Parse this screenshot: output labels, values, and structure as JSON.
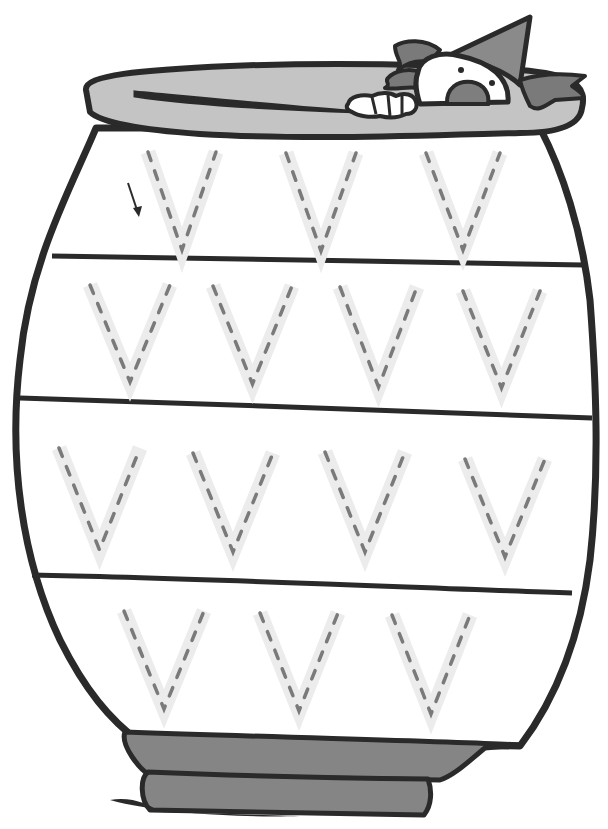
{
  "worksheet": {
    "letter": "V",
    "description": "Letter V tracing worksheet: a pot with four bands of dashed V letters and a clown peeking over the rim",
    "colors": {
      "outline": "#2a2a2a",
      "rim_fill": "#c4c4c4",
      "base_fill": "#858585",
      "clown_hat": "#8a8a8a",
      "clown_hair": "#7a7a7a",
      "clown_mouth": "#7e7e7e",
      "trace_band": "#ececec",
      "trace_dash": "#7a7a7a",
      "paper": "#ffffff"
    },
    "start_arrow": {
      "x1": 128,
      "y1": 183,
      "x2": 138,
      "y2": 215
    },
    "rows": [
      {
        "name": "row-1",
        "letters": [
          {
            "left": 148,
            "right": 216,
            "top": 152,
            "bottom": 250
          },
          {
            "left": 286,
            "right": 356,
            "top": 153,
            "bottom": 251
          },
          {
            "left": 426,
            "right": 500,
            "top": 153,
            "bottom": 250
          }
        ]
      },
      {
        "name": "row-2",
        "letters": [
          {
            "left": 90,
            "right": 170,
            "top": 285,
            "bottom": 382
          },
          {
            "left": 213,
            "right": 292,
            "top": 286,
            "bottom": 384
          },
          {
            "left": 340,
            "right": 417,
            "top": 287,
            "bottom": 387
          },
          {
            "left": 463,
            "right": 540,
            "top": 291,
            "bottom": 388
          }
        ]
      },
      {
        "name": "row-3",
        "letters": [
          {
            "left": 59,
            "right": 140,
            "top": 448,
            "bottom": 550
          },
          {
            "left": 193,
            "right": 273,
            "top": 453,
            "bottom": 552
          },
          {
            "left": 325,
            "right": 405,
            "top": 452,
            "bottom": 552
          },
          {
            "left": 465,
            "right": 545,
            "top": 459,
            "bottom": 557
          }
        ]
      },
      {
        "name": "row-4",
        "letters": [
          {
            "left": 124,
            "right": 204,
            "top": 611,
            "bottom": 709
          },
          {
            "left": 260,
            "right": 338,
            "top": 613,
            "bottom": 711
          },
          {
            "left": 392,
            "right": 470,
            "top": 615,
            "bottom": 714
          }
        ]
      }
    ],
    "counts": {
      "rows": 4,
      "letters_total": 14
    }
  }
}
